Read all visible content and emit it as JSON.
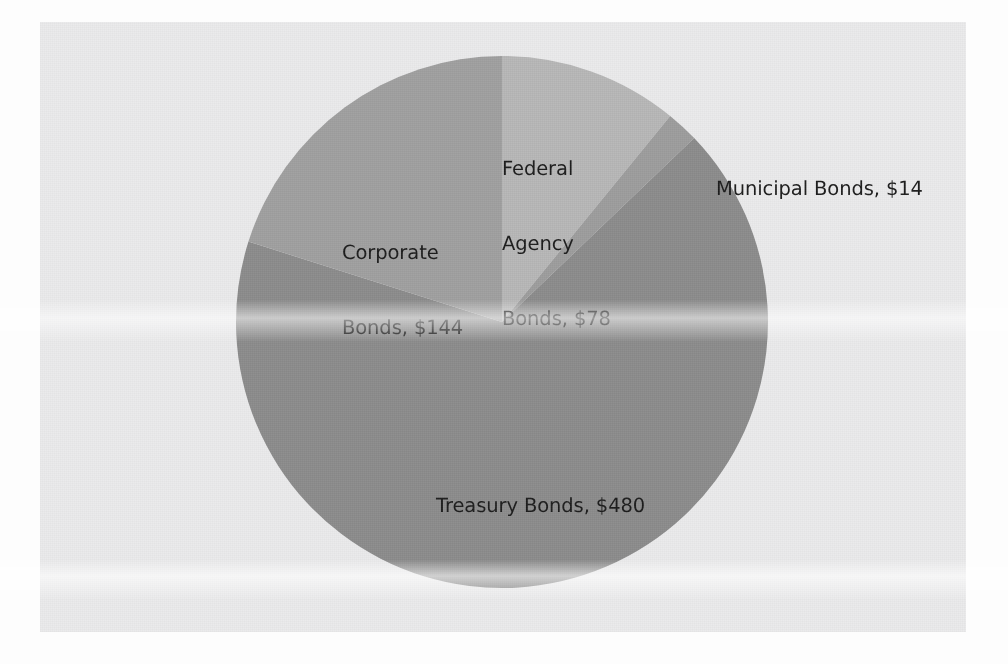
{
  "chart_data": {
    "type": "pie",
    "title": "",
    "subtitle": "",
    "xlabel": "",
    "ylabel": "",
    "grid": false,
    "legend": "none",
    "label_format": "{name}, ${value}",
    "units": "USD (billions)",
    "total": 716,
    "categories": [
      "Federal Agency Bonds",
      "Municipal Bonds",
      "Treasury Bonds",
      "Corporate Bonds"
    ],
    "values": [
      78,
      14,
      480,
      144
    ],
    "start_angle_deg": 0,
    "direction": "clockwise",
    "slices": [
      {
        "name": "Federal Agency Bonds",
        "value": 78,
        "value_label": "$78",
        "percent": 10.9,
        "color": "#b7b7b7",
        "start_deg": 0,
        "sweep_deg": 39.22,
        "label_lines": [
          "Federal",
          "Agency",
          "Bonds, $78"
        ]
      },
      {
        "name": "Municipal Bonds",
        "value": 14,
        "value_label": "$14",
        "percent": 2.0,
        "color": "#9c9c9c",
        "start_deg": 39.22,
        "sweep_deg": 7.04,
        "label_lines": [
          "Municipal Bonds, $14"
        ]
      },
      {
        "name": "Treasury Bonds",
        "value": 480,
        "value_label": "$480",
        "percent": 67.0,
        "color": "#8b8b8b",
        "start_deg": 46.26,
        "sweep_deg": 241.34,
        "label_lines": [
          "Treasury Bonds, $480"
        ]
      },
      {
        "name": "Corporate Bonds",
        "value": 144,
        "value_label": "$144",
        "percent": 20.1,
        "color": "#9f9f9f",
        "start_deg": 287.6,
        "sweep_deg": 72.4,
        "label_lines": [
          "Corporate Bonds, $144"
        ]
      }
    ],
    "geometry": {
      "center_x": 462,
      "center_y": 300,
      "radius": 266
    },
    "colors": {
      "panel_background": "#ebebec",
      "page_background": "#fdfdfd",
      "label_text": "#1b1b1b"
    }
  },
  "labels": {
    "federal": {
      "l1": "Federal",
      "l2": "Agency",
      "l3": "Bonds, $78"
    },
    "municipal": {
      "l1": "Municipal Bonds, $14"
    },
    "corporate": {
      "l1": "Corporate",
      "l2": "Bonds, $144"
    },
    "treasury": {
      "l1": "Treasury Bonds, $480"
    }
  }
}
